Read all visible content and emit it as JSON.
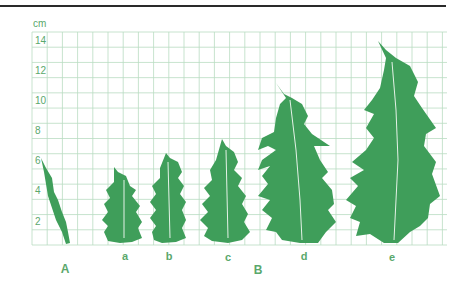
{
  "figure": {
    "unit": "cm",
    "y_ticks": [
      "14",
      "12",
      "10",
      "8",
      "6",
      "4",
      "2"
    ],
    "group_labels": {
      "A": "A",
      "B": "B"
    },
    "specimen_labels": {
      "a": "a",
      "b": "b",
      "c": "c",
      "d": "d",
      "e": "e"
    },
    "colors": {
      "leaf": "#3f9e5a",
      "grid": "#b9dcc2",
      "text": "#5aa86c",
      "rule": "#2a2a2a"
    }
  },
  "chart_data": {
    "type": "bar",
    "title": "",
    "xlabel": "",
    "ylabel": "cm",
    "ylim": [
      0,
      14
    ],
    "grid": true,
    "categories": [
      "A",
      "a",
      "b",
      "c",
      "d",
      "e"
    ],
    "groups": {
      "A": [
        "A"
      ],
      "B": [
        "a",
        "b",
        "c",
        "d",
        "e"
      ]
    },
    "values": [
      5.8,
      5.3,
      6.2,
      7.4,
      10.8,
      14.0
    ],
    "y_tick_labels": [
      "2",
      "4",
      "6",
      "8",
      "10",
      "12",
      "14"
    ],
    "annotations": [
      "A",
      "B"
    ]
  }
}
